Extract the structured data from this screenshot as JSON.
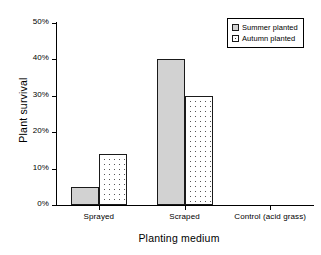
{
  "chart_data": {
    "type": "bar",
    "title": "",
    "xlabel": "Planting medium",
    "ylabel": "Plant survival",
    "categories": [
      "Sprayed",
      "Scraped",
      "Control (acid grass)"
    ],
    "series": [
      {
        "name": "Summer planted",
        "values": [
          5,
          40,
          0
        ],
        "fill": "solid-gray",
        "color": "#d2d2d2"
      },
      {
        "name": "Autumn planted",
        "values": [
          14,
          30,
          0
        ],
        "fill": "dotted",
        "color": "#ffffff"
      }
    ],
    "ylim": [
      0,
      50
    ],
    "yticks": [
      0,
      10,
      20,
      30,
      40,
      50
    ],
    "ytick_labels": [
      "0%",
      "10%",
      "20%",
      "30%",
      "40%",
      "50%"
    ],
    "grid": false,
    "legend_position": "top-right",
    "axis_color": "#000000",
    "bar_outline_color": "#1a1a1a",
    "background": "#ffffff"
  },
  "legend": {
    "entries": [
      {
        "label": "Summer planted"
      },
      {
        "label": "Autumn planted"
      }
    ]
  },
  "axes": {
    "y_title": "Plant survival",
    "x_title": "Planting medium"
  }
}
